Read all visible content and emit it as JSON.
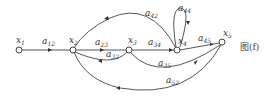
{
  "diagram": {
    "type": "signal-flow-graph",
    "caption": "图(f)",
    "nodes": [
      {
        "id": "x1",
        "name": "x",
        "sub": "1"
      },
      {
        "id": "x2",
        "name": "x",
        "sub": "2"
      },
      {
        "id": "x3",
        "name": "x",
        "sub": "3"
      },
      {
        "id": "x4",
        "name": "x",
        "sub": "4"
      },
      {
        "id": "x5",
        "name": "x",
        "sub": "5"
      }
    ],
    "edges": [
      {
        "from": "x1",
        "to": "x2",
        "name": "a",
        "sub": "12"
      },
      {
        "from": "x2",
        "to": "x3",
        "name": "a",
        "sub": "23"
      },
      {
        "from": "x3",
        "to": "x2",
        "name": "a",
        "sub": "32"
      },
      {
        "from": "x3",
        "to": "x4",
        "name": "a",
        "sub": "34"
      },
      {
        "from": "x4",
        "to": "x2",
        "name": "a",
        "sub": "42"
      },
      {
        "from": "x4",
        "to": "x4",
        "name": "a",
        "sub": "44"
      },
      {
        "from": "x4",
        "to": "x5",
        "name": "a",
        "sub": "45"
      },
      {
        "from": "x3",
        "to": "x5",
        "name": "a",
        "sub": "35"
      },
      {
        "from": "x5",
        "to": "x2",
        "name": "a",
        "sub": "52"
      }
    ]
  }
}
